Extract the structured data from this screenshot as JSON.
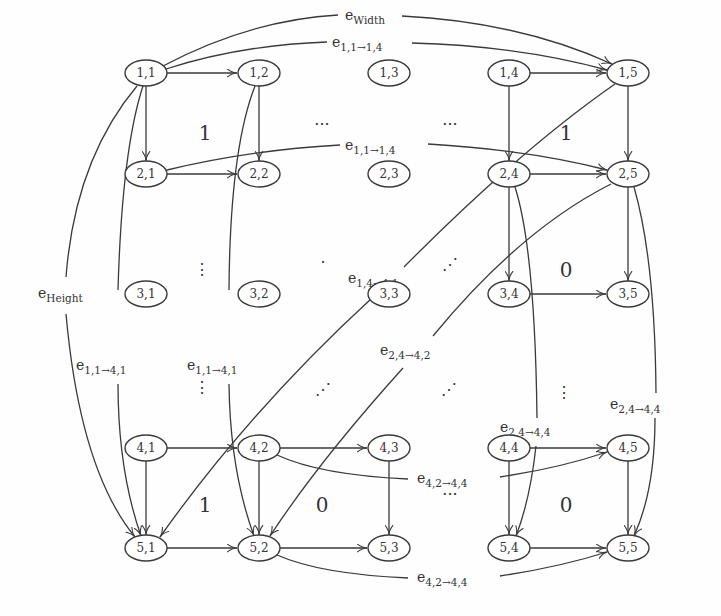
{
  "diagram": {
    "type": "grid-graph",
    "nodes": [
      {
        "id": "1,1",
        "label": "1,1",
        "x": 146,
        "y": 73
      },
      {
        "id": "1,2",
        "label": "1,2",
        "x": 259,
        "y": 73
      },
      {
        "id": "1,3",
        "label": "1,3",
        "x": 389,
        "y": 73
      },
      {
        "id": "1,4",
        "label": "1,4",
        "x": 509,
        "y": 73
      },
      {
        "id": "1,5",
        "label": "1,5",
        "x": 628,
        "y": 73
      },
      {
        "id": "2,1",
        "label": "2,1",
        "x": 146,
        "y": 174
      },
      {
        "id": "2,2",
        "label": "2,2",
        "x": 259,
        "y": 174
      },
      {
        "id": "2,3",
        "label": "2,3",
        "x": 389,
        "y": 174
      },
      {
        "id": "2,4",
        "label": "2,4",
        "x": 509,
        "y": 174
      },
      {
        "id": "2,5",
        "label": "2,5",
        "x": 628,
        "y": 174
      },
      {
        "id": "3,1",
        "label": "3,1",
        "x": 146,
        "y": 294
      },
      {
        "id": "3,2",
        "label": "3,2",
        "x": 259,
        "y": 294
      },
      {
        "id": "3,3",
        "label": "3,3",
        "x": 389,
        "y": 294
      },
      {
        "id": "3,4",
        "label": "3,4",
        "x": 509,
        "y": 294
      },
      {
        "id": "3,5",
        "label": "3,5",
        "x": 628,
        "y": 294
      },
      {
        "id": "4,1",
        "label": "4,1",
        "x": 146,
        "y": 448
      },
      {
        "id": "4,2",
        "label": "4,2",
        "x": 259,
        "y": 448
      },
      {
        "id": "4,3",
        "label": "4,3",
        "x": 389,
        "y": 448
      },
      {
        "id": "4,4",
        "label": "4,4",
        "x": 509,
        "y": 448
      },
      {
        "id": "4,5",
        "label": "4,5",
        "x": 628,
        "y": 448
      },
      {
        "id": "5,1",
        "label": "5,1",
        "x": 146,
        "y": 548
      },
      {
        "id": "5,2",
        "label": "5,2",
        "x": 259,
        "y": 548
      },
      {
        "id": "5,3",
        "label": "5,3",
        "x": 389,
        "y": 548
      },
      {
        "id": "5,4",
        "label": "5,4",
        "x": 509,
        "y": 548
      },
      {
        "id": "5,5",
        "label": "5,5",
        "x": 628,
        "y": 548
      }
    ],
    "edge_labels": {
      "e_width": {
        "base": "e",
        "sub": "Width"
      },
      "e_height": {
        "base": "e",
        "sub": "Height"
      },
      "e_11_14_top": {
        "base": "e",
        "sub": "1,1→1,4"
      },
      "e_11_14_mid": {
        "base": "e",
        "sub": "1,1→1,4"
      },
      "e_11_41_a": {
        "base": "e",
        "sub": "1,1→4,1"
      },
      "e_11_41_b": {
        "base": "e",
        "sub": "1,1→4,1"
      },
      "e_14_41": {
        "base": "e",
        "sub": "1,4→4,1"
      },
      "e_24_42": {
        "base": "e",
        "sub": "2,4→4,2"
      },
      "e_24_44_a": {
        "base": "e",
        "sub": "2,4→4,4"
      },
      "e_24_44_b": {
        "base": "e",
        "sub": "2,4→4,4"
      },
      "e_42_44_a": {
        "base": "e",
        "sub": "4,2→4,4"
      },
      "e_42_44_b": {
        "base": "e",
        "sub": "4,2→4,4"
      }
    },
    "region_labels": [
      {
        "text": "1",
        "x": 205,
        "y": 133
      },
      {
        "text": "1",
        "x": 566,
        "y": 133
      },
      {
        "text": "0",
        "x": 566,
        "y": 270
      },
      {
        "text": "1",
        "x": 205,
        "y": 505
      },
      {
        "text": "0",
        "x": 322,
        "y": 505
      },
      {
        "text": "0",
        "x": 566,
        "y": 505
      }
    ],
    "ellipsis": {
      "h": "···",
      "v": "⋮",
      "d": "⋰"
    }
  }
}
